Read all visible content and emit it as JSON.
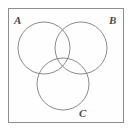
{
  "figure": {
    "type": "venn-diagram",
    "set_count": 3,
    "frame": {
      "border_color": "#8e8e8e",
      "fill_color": "#fefefe",
      "x": 8,
      "y": 8,
      "width": 116,
      "height": 115
    },
    "stroke_color": "#7d7d7d",
    "stroke_width": 0.9,
    "circle_fill": "none",
    "labels": {
      "a": "A",
      "b": "B",
      "c": "C"
    },
    "circles": [
      {
        "name": "A",
        "cx": 44,
        "cy": 48,
        "r": 26
      },
      {
        "name": "B",
        "cx": 81,
        "cy": 48,
        "r": 26
      },
      {
        "name": "C",
        "cx": 63,
        "cy": 84,
        "r": 26
      }
    ]
  },
  "chart_data": {
    "type": "diagram",
    "title": "",
    "diagram_kind": "three-set Venn diagram",
    "sets": [
      "A",
      "B",
      "C"
    ],
    "regions": [
      "A only",
      "B only",
      "C only",
      "A ∩ B",
      "A ∩ C",
      "B ∩ C",
      "A ∩ B ∩ C",
      "outside all sets (universal set)"
    ]
  }
}
